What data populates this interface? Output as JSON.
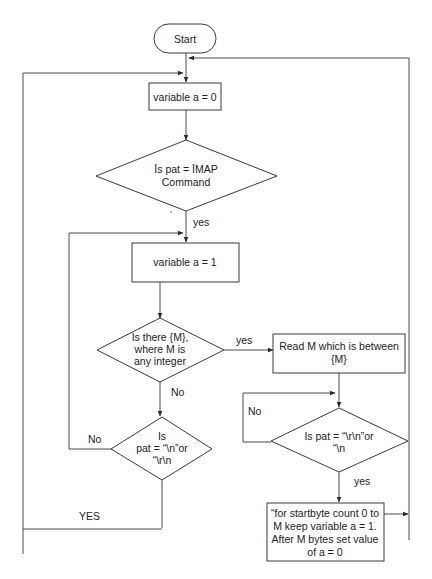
{
  "diagram": {
    "type": "flowchart",
    "nodes": {
      "start": {
        "shape": "terminator",
        "lines": [
          "Start"
        ]
      },
      "set_a0": {
        "shape": "process",
        "lines": [
          "variable a = 0"
        ]
      },
      "is_imap": {
        "shape": "decision",
        "lines": [
          "Īs pat = ĪMAP",
          "Command"
        ]
      },
      "set_a1": {
        "shape": "process",
        "lines": [
          "variable a = 1"
        ]
      },
      "has_m": {
        "shape": "decision",
        "lines": [
          "Is there {M},",
          "where M is",
          "any integer"
        ]
      },
      "is_newline_left": {
        "shape": "decision",
        "lines": [
          "Is",
          "pat = “\\n”or",
          "“\\r\\n"
        ]
      },
      "read_m": {
        "shape": "process",
        "lines": [
          "Read M which is between",
          "{M}"
        ]
      },
      "is_newline_right": {
        "shape": "decision",
        "lines": [
          "Is pat = “\\r\\n”or",
          "“\\n"
        ]
      },
      "startbyte": {
        "shape": "process",
        "lines": [
          "“for startbyte count 0 to",
          "M keep variable a = 1.",
          "After M bytes set value",
          "of a = 0"
        ]
      }
    },
    "edge_labels": {
      "imap_yes": "yes",
      "has_m_yes": "yes",
      "has_m_no": "No",
      "left_no": "No",
      "left_yes": "YES",
      "right_no": "No",
      "right_yes": "yes"
    },
    "colors": {
      "stroke": "#3a3a3a",
      "text": "#222222",
      "background": "#ffffff"
    }
  }
}
